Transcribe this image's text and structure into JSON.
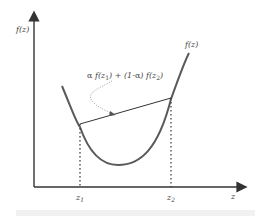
{
  "figure": {
    "y_axis_label": "f(z)",
    "x_axis_label": "z",
    "curve_label": "f(z)",
    "chord_label": {
      "alpha": "α",
      "f1_prefix": " f(z",
      "sub1": "1",
      "middle": ") + (1-",
      "alpha2": "α",
      "f2_prefix": ") f(z",
      "sub2": "2",
      "close": ")"
    },
    "tick_z1": {
      "base": "z",
      "sub": "1"
    },
    "tick_z2": {
      "base": "z",
      "sub": "2"
    },
    "colors": {
      "axis": "#333333",
      "curve": "#555555",
      "chord": "#333333",
      "dashed": "#333333",
      "pointer": "#888888",
      "text": "#444444"
    }
  }
}
